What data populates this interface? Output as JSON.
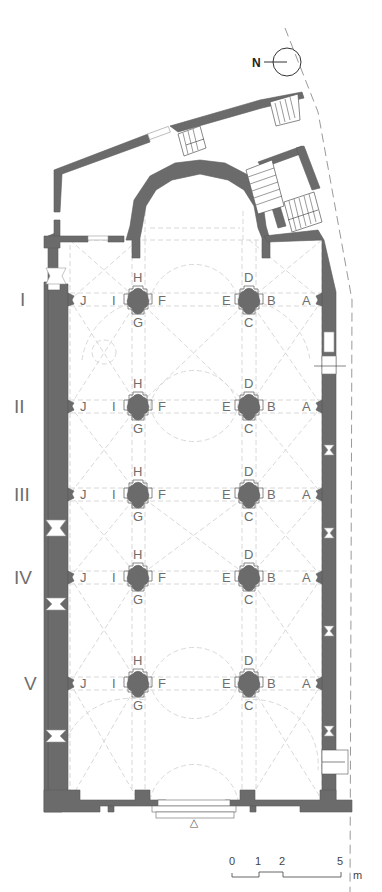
{
  "plan": {
    "north": {
      "label": "N"
    },
    "bays": [
      {
        "numeral": "I",
        "y": 299
      },
      {
        "numeral": "II",
        "y": 406
      },
      {
        "numeral": "III",
        "y": 493
      },
      {
        "numeral": "IV",
        "y": 577
      },
      {
        "numeral": "V",
        "y": 683
      }
    ],
    "pier_labels": {
      "west_wall": "J",
      "west_pier": {
        "top": "H",
        "left": "I",
        "right": "F",
        "bottom": "G"
      },
      "east_pier": {
        "top": "D",
        "left": "E",
        "right": "B",
        "bottom": "C"
      },
      "east_wall": "A"
    },
    "entrance_marker": "△",
    "scale_bar": {
      "ticks": [
        "0",
        "1",
        "2",
        "5"
      ],
      "unit": "m"
    }
  },
  "colors": {
    "wall": "#6b6b6b",
    "guides": "#d4d4d4",
    "labels": "#6e6e6e",
    "background": "#ffffff"
  }
}
